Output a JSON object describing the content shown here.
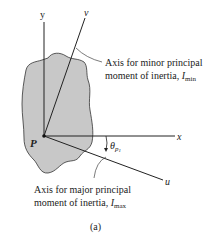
{
  "figure": {
    "caption": "(a)",
    "origin_label": "P",
    "axes": {
      "y": "y",
      "x": "x",
      "v": "v",
      "u": "u"
    },
    "angle_label": {
      "symbol": "θ",
      "subscript": "p",
      "sub_subscript": "1"
    },
    "annotations": {
      "minor": {
        "line1": "Axis for minor principal",
        "line2_prefix": "moment of inertia, ",
        "symbol": "I",
        "subscript": "min"
      },
      "major": {
        "line1": "Axis for major principal",
        "line2_prefix": "moment of inertia, ",
        "symbol": "I",
        "subscript": "max"
      }
    },
    "colors": {
      "shape_fill": "#c8c8c8",
      "line": "#222222"
    }
  }
}
